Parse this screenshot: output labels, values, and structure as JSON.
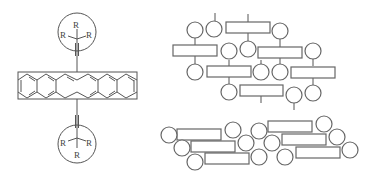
{
  "molecule": {
    "substituent_label": "R",
    "top_group": {
      "labels": [
        "R",
        "R",
        "R"
      ]
    },
    "bottom_group": {
      "labels": [
        "R",
        "R",
        "R"
      ]
    },
    "core": "acene-backbone"
  },
  "packing_models": {
    "upper": {
      "style": "brick-layer with side groups",
      "rect_count": 8,
      "circle_count": 15
    },
    "lower": {
      "style": "slipped stack",
      "rect_count": 6,
      "circle_count": 12
    }
  },
  "colors": {
    "line": "#555555",
    "background": "#ffffff"
  }
}
